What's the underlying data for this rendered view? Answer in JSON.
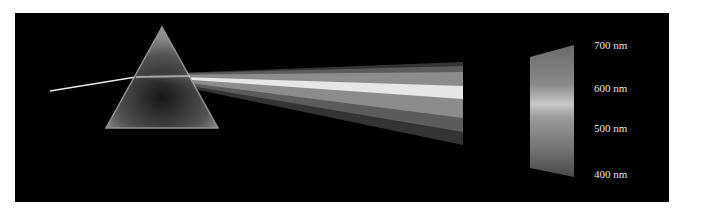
{
  "figure": {
    "background": "#000000",
    "labels": [
      {
        "text": "700 nm",
        "y": 39
      },
      {
        "text": "600 nm",
        "y": 82
      },
      {
        "text": "500 nm",
        "y": 122
      },
      {
        "text": "400 nm",
        "y": 168
      }
    ]
  }
}
